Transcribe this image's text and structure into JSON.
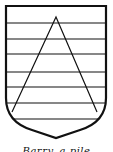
{
  "figure": {
    "stroke_color": "#111111",
    "fill_color": "#ffffff",
    "horizontal_bars_y": [
      23,
      39,
      54,
      72,
      87,
      103,
      119
    ],
    "caption": "Barry, a pile"
  }
}
